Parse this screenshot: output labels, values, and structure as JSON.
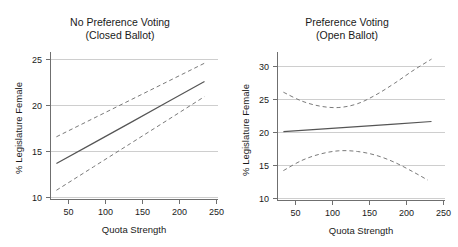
{
  "figure": {
    "background": "#ffffff",
    "line_color": "#555555",
    "ci_color": "#7a7a7a",
    "grid_color": "#b9b9b9",
    "axis_color": "#6f6f6f"
  },
  "chart_data": [
    {
      "type": "line",
      "panel": "left",
      "title": "No Preference Voting",
      "subtitle": "(Closed Ballot)",
      "xlabel": "Quota Strength",
      "ylabel": "% Legislature Female",
      "xlim": [
        25,
        258
      ],
      "ylim": [
        8.8,
        26.2
      ],
      "xticks": [
        50,
        100,
        150,
        200,
        250
      ],
      "yticks": [
        10,
        15,
        20,
        25
      ],
      "grid": true,
      "legend": "none",
      "series": [
        {
          "name": "Predicted % legislature female",
          "style": "solid",
          "x": [
            33,
            83,
            133,
            183,
            233
          ],
          "values": [
            13.1,
            15.55,
            18.0,
            20.45,
            22.9
          ]
        },
        {
          "name": "Upper 95% confidence bound",
          "style": "dashed",
          "x": [
            33,
            83,
            133,
            183,
            233
          ],
          "values": [
            16.3,
            18.5,
            20.7,
            22.9,
            25.1
          ]
        },
        {
          "name": "Lower 95% confidence bound",
          "style": "dashed",
          "x": [
            33,
            83,
            133,
            183,
            233
          ],
          "values": [
            9.9,
            12.7,
            15.5,
            18.3,
            21.1
          ]
        }
      ]
    },
    {
      "type": "line",
      "panel": "right",
      "title": "Preference Voting",
      "subtitle": "(Open Ballot)",
      "xlabel": "Quota Strength",
      "ylabel": "% Legislature Female",
      "xlim": [
        25,
        258
      ],
      "ylim": [
        9.4,
        32.4
      ],
      "xticks": [
        50,
        100,
        150,
        200,
        250
      ],
      "yticks": [
        10,
        15,
        20,
        25,
        30
      ],
      "grid": true,
      "legend": "none",
      "series": [
        {
          "name": "Predicted % legislature female",
          "style": "solid",
          "x": [
            33,
            83,
            133,
            183,
            233
          ],
          "values": [
            20.2,
            20.6,
            21.0,
            21.4,
            21.8
          ]
        },
        {
          "name": "Upper 95% confidence bound",
          "style": "dashed",
          "x": [
            33,
            58,
            83,
            108,
            133,
            158,
            183,
            208,
            233
          ],
          "values": [
            26.4,
            25.0,
            24.2,
            24.0,
            24.6,
            26.0,
            27.8,
            29.8,
            31.6
          ]
        },
        {
          "name": "Lower 95% confidence bound",
          "style": "dashed",
          "x": [
            33,
            58,
            83,
            108,
            133,
            158,
            183,
            208,
            228
          ],
          "values": [
            14.1,
            15.7,
            16.7,
            17.2,
            17.1,
            16.5,
            15.4,
            13.9,
            12.6
          ]
        }
      ]
    }
  ]
}
